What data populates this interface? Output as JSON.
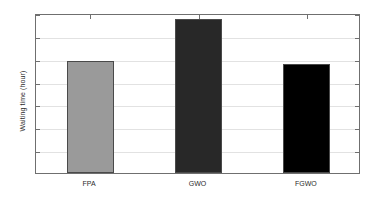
{
  "chart_data": {
    "type": "bar",
    "title": "",
    "xlabel": "",
    "ylabel": "Waiting time (hour)",
    "categories": [
      "FPA",
      "GWO",
      "FGWO"
    ],
    "values": [
      2.44,
      3.37,
      2.39
    ],
    "series": [
      {
        "name": "Waiting time",
        "values": [
          2.44,
          3.37,
          2.39
        ]
      }
    ],
    "bar_colors": [
      "#9a9a9a",
      "#282828",
      "#000000"
    ],
    "bar_edge_color": "#4a4a4a",
    "ylim": [
      0,
      3.5
    ],
    "yticks": [
      0,
      0.5,
      1,
      1.5,
      2,
      2.5,
      3,
      3.5
    ],
    "ytick_labels": [
      "0",
      "0.5",
      "1",
      "1.5",
      "2",
      "2.5",
      "3",
      "3.5"
    ],
    "grid": true,
    "grid_color": "#e2e2e2",
    "legend": null,
    "legend_position": "none",
    "axis_color": "#6f6f6f",
    "background": "#ffffff"
  }
}
